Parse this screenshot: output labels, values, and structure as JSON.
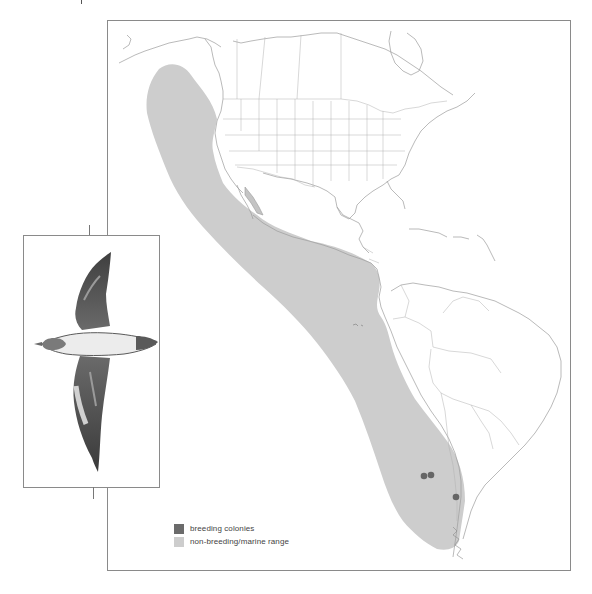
{
  "figure": {
    "title": "",
    "map": {
      "region": "Western Hemisphere — Americas and eastern Pacific",
      "range_fill_color": "#c8c8c8",
      "colony_color": "#6a6a6a",
      "coastline_color": "#9a9a9a",
      "frame_color": "#8a8a8a",
      "breeding_colonies": [
        {
          "id": "colony-1",
          "label": "breeding colony",
          "x_px": 423,
          "y_px": 475
        },
        {
          "id": "colony-2",
          "label": "breeding colony",
          "x_px": 430,
          "y_px": 474
        },
        {
          "id": "colony-3",
          "label": "breeding colony",
          "x_px": 455,
          "y_px": 496
        }
      ]
    },
    "illustration": {
      "subject": "seabird in flight (shearwater), viewed from below",
      "label": ""
    },
    "legend": {
      "items": [
        {
          "label": "breeding colonies",
          "color": "#6b6b6b"
        },
        {
          "label": "non-breeding/marine range",
          "color": "#cdcdcd"
        }
      ]
    }
  }
}
